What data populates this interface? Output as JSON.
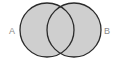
{
  "diagram": {
    "type": "venn",
    "shaded_region": "A union B",
    "sets": [
      {
        "id": "A",
        "label": "A",
        "cx": 47,
        "cy": 30,
        "r": 27
      },
      {
        "id": "B",
        "label": "B",
        "cx": 74,
        "cy": 30,
        "r": 27
      }
    ],
    "colors": {
      "fill": "#cfcfcf",
      "stroke": "#2b2b2b",
      "label": "#8a8a8a",
      "background": "#ffffff"
    }
  }
}
